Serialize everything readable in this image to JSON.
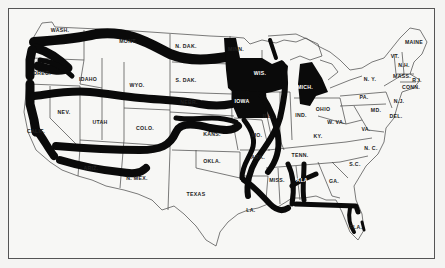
{
  "map": {
    "title": "",
    "style": {
      "ink": "#0a0a0a",
      "paper": "#f7f7f5",
      "border": "#444444"
    },
    "state_labels": [
      {
        "id": "wash",
        "text": "WASH.",
        "x": 60,
        "y": 32
      },
      {
        "id": "oreg",
        "text": "OREG.",
        "x": 42,
        "y": 75
      },
      {
        "id": "calif",
        "text": "CALIF.",
        "x": 36,
        "y": 133
      },
      {
        "id": "idaho",
        "text": "IDAHO",
        "x": 88,
        "y": 81
      },
      {
        "id": "nev",
        "text": "NEV.",
        "x": 64,
        "y": 114
      },
      {
        "id": "mont",
        "text": "MONT.",
        "x": 128,
        "y": 43
      },
      {
        "id": "wyo",
        "text": "WYO.",
        "x": 137,
        "y": 87
      },
      {
        "id": "utah",
        "text": "UTAH",
        "x": 100,
        "y": 124
      },
      {
        "id": "colo",
        "text": "COLO.",
        "x": 145,
        "y": 130
      },
      {
        "id": "ariz",
        "text": "ARIZ.",
        "x": 91,
        "y": 170
      },
      {
        "id": "nmex",
        "text": "N. MEX.",
        "x": 137,
        "y": 180
      },
      {
        "id": "ndak",
        "text": "N. DAK.",
        "x": 186,
        "y": 48
      },
      {
        "id": "sdak",
        "text": "S. DAK.",
        "x": 186,
        "y": 82
      },
      {
        "id": "nebr",
        "text": "NEBR.",
        "x": 189,
        "y": 104
      },
      {
        "id": "kans",
        "text": "KANS.",
        "x": 212,
        "y": 136
      },
      {
        "id": "okla",
        "text": "OKLA.",
        "x": 212,
        "y": 163
      },
      {
        "id": "texas",
        "text": "TEXAS",
        "x": 196,
        "y": 196
      },
      {
        "id": "minn",
        "text": "MINN.",
        "x": 236,
        "y": 51
      },
      {
        "id": "iowa",
        "text": "IOWA",
        "x": 242,
        "y": 103,
        "inverse": true
      },
      {
        "id": "mo",
        "text": "MO.",
        "x": 257,
        "y": 137
      },
      {
        "id": "ark",
        "text": "ARK.",
        "x": 258,
        "y": 159
      },
      {
        "id": "la",
        "text": "LA.",
        "x": 251,
        "y": 212
      },
      {
        "id": "wis",
        "text": "WIS.",
        "x": 260,
        "y": 75,
        "inverse": true
      },
      {
        "id": "ill",
        "text": "ILL.",
        "x": 268,
        "y": 118
      },
      {
        "id": "miss",
        "text": "MISS.",
        "x": 277,
        "y": 182
      },
      {
        "id": "mich",
        "text": "MICH.",
        "x": 305,
        "y": 89,
        "inverse": true
      },
      {
        "id": "ind",
        "text": "IND.",
        "x": 301,
        "y": 117
      },
      {
        "id": "ohio",
        "text": "OHIO",
        "x": 323,
        "y": 111
      },
      {
        "id": "ky",
        "text": "KY.",
        "x": 318,
        "y": 138
      },
      {
        "id": "tenn",
        "text": "TENN.",
        "x": 300,
        "y": 157
      },
      {
        "id": "ala",
        "text": "ALA.",
        "x": 303,
        "y": 182,
        "inverse": true
      },
      {
        "id": "ga",
        "text": "GA.",
        "x": 334,
        "y": 183
      },
      {
        "id": "fla",
        "text": "FLA.",
        "x": 356,
        "y": 229
      },
      {
        "id": "sc",
        "text": "S.C.",
        "x": 355,
        "y": 166
      },
      {
        "id": "nc",
        "text": "N. C.",
        "x": 371,
        "y": 150
      },
      {
        "id": "va",
        "text": "VA.",
        "x": 366,
        "y": 131
      },
      {
        "id": "wva",
        "text": "W. VA.",
        "x": 336,
        "y": 124
      },
      {
        "id": "md",
        "text": "MD.",
        "x": 376,
        "y": 112
      },
      {
        "id": "del",
        "text": "DEL.",
        "x": 396,
        "y": 118
      },
      {
        "id": "pa",
        "text": "PA.",
        "x": 364,
        "y": 99
      },
      {
        "id": "ny",
        "text": "N. Y.",
        "x": 370,
        "y": 81
      },
      {
        "id": "nj",
        "text": "N.J.",
        "x": 399,
        "y": 103
      },
      {
        "id": "vt",
        "text": "VT.",
        "x": 395,
        "y": 58
      },
      {
        "id": "nh",
        "text": "N.H.",
        "x": 404,
        "y": 67
      },
      {
        "id": "maine",
        "text": "MAINE",
        "x": 414,
        "y": 44
      },
      {
        "id": "mass",
        "text": "MASS.",
        "x": 402,
        "y": 78
      },
      {
        "id": "ri",
        "text": "R.I.",
        "x": 417,
        "y": 82
      },
      {
        "id": "conn",
        "text": "CONN.",
        "x": 411,
        "y": 89
      }
    ]
  }
}
